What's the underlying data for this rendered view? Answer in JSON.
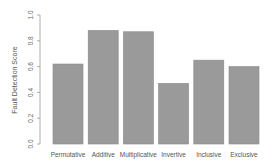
{
  "chart_data": {
    "type": "bar",
    "title": "",
    "xlabel": "",
    "ylabel": "Fault Detection Score",
    "ylim": [
      0,
      1.0
    ],
    "yticks": [
      "0.0",
      "0.2",
      "0.4",
      "0.6",
      "0.8",
      "1.0"
    ],
    "categories": [
      "Permutative",
      "Additive",
      "Multiplicative",
      "Invertive",
      "Inclusive",
      "Exclusive"
    ],
    "values": [
      0.62,
      0.88,
      0.87,
      0.47,
      0.65,
      0.6
    ],
    "grid": false,
    "legend": null,
    "bar_color": "#9a9a9a",
    "bar_edge_color": "#888888"
  }
}
